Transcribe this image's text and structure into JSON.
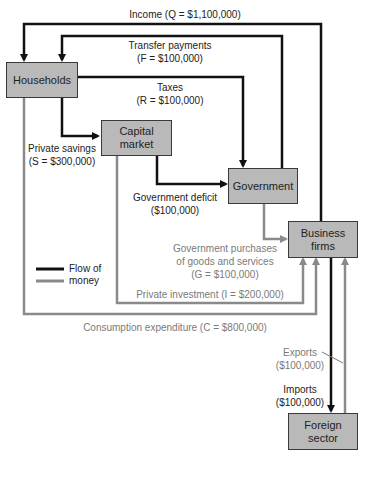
{
  "diagram": {
    "type": "circular-flow",
    "nodes": {
      "households": "Households",
      "capital_market": [
        "Capital",
        "market"
      ],
      "government": "Government",
      "business_firms": [
        "Business",
        "firms"
      ],
      "foreign_sector": [
        "Foreign",
        "sector"
      ]
    },
    "flows": {
      "income": {
        "label": "Income",
        "var": "Q",
        "value": "$1,100,000",
        "from": "Business firms",
        "to": "Households",
        "kind": "black"
      },
      "transfer": {
        "label": "Transfer payments",
        "var": "F",
        "value": "$100,000",
        "from": "Government",
        "to": "Households",
        "kind": "black"
      },
      "taxes": {
        "label": "Taxes",
        "var": "R",
        "value": "$100,000",
        "from": "Households",
        "to": "Government",
        "kind": "black"
      },
      "savings": {
        "label": "Private savings",
        "var": "S",
        "value": "$300,000",
        "from": "Households",
        "to": "Capital market",
        "kind": "black"
      },
      "deficit": {
        "label": "Government deficit",
        "value": "($100,000)",
        "from": "Capital market",
        "to": "Government",
        "kind": "black"
      },
      "gov_purchases": {
        "label1": "Government purchases",
        "label2": "of goods and services",
        "var": "G",
        "value": "$100,000",
        "from": "Government",
        "to": "Business firms",
        "kind": "gray"
      },
      "investment": {
        "label": "Private investment",
        "var": "I",
        "value": "$200,000",
        "from": "Capital market",
        "to": "Business firms",
        "kind": "gray"
      },
      "consumption": {
        "label": "Consumption expenditure",
        "var": "C",
        "value": "$800,000",
        "from": "Households",
        "to": "Business firms",
        "kind": "gray"
      },
      "exports": {
        "label": "Exports",
        "value": "($100,000)",
        "from": "Foreign sector",
        "to": "Business firms",
        "kind": "gray"
      },
      "imports": {
        "label": "Imports",
        "value": "($100,000)",
        "from": "Business firms",
        "to": "Foreign sector",
        "kind": "black"
      }
    },
    "legend": {
      "line1": "Flow of",
      "line2": "money"
    },
    "colors": {
      "black_flow": "#111111",
      "gray_flow": "#8a8a8a",
      "box_fill": "#b9b9b9",
      "gray_text": "#7a7a7a"
    }
  },
  "text": {
    "income_label": "Income (Q = $1,100,000)",
    "transfer_l1": "Transfer payments",
    "transfer_l2": "(F = $100,000)",
    "taxes_l1": "Taxes",
    "taxes_l2": "(R = $100,000)",
    "savings_l1": "Private savings",
    "savings_l2": "(S = $300,000)",
    "deficit_l1": "Government deficit",
    "deficit_l2": "($100,000)",
    "gp_l1": "Government purchases",
    "gp_l2": "of goods and services",
    "gp_l3": "(G = $100,000)",
    "inv_label": "Private investment (I = $200,000)",
    "cons_label": "Consumption expenditure (C = $800,000)",
    "exports_l1": "Exports",
    "exports_l2": "($100,000)",
    "imports_l1": "Imports",
    "imports_l2": "($100,000)",
    "legend_l1": "Flow of",
    "legend_l2": "money",
    "households": "Households",
    "capital_l1": "Capital",
    "capital_l2": "market",
    "government": "Government",
    "business_l1": "Business",
    "business_l2": "firms",
    "foreign_l1": "Foreign",
    "foreign_l2": "sector"
  }
}
